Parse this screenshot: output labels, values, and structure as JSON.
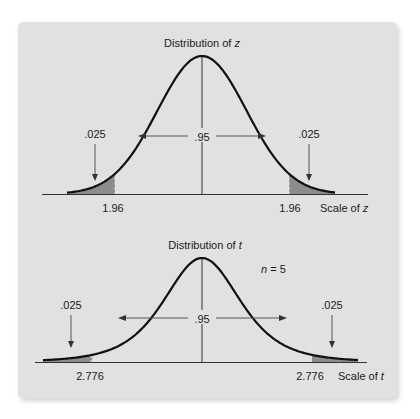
{
  "chart_data": [
    {
      "type": "area",
      "title": "Distribution of ",
      "title_var": "z",
      "distribution": "normal",
      "x_range": [
        -3.6,
        3.6
      ],
      "critical_values": [
        -1.96,
        1.96
      ],
      "critical_labels": [
        "1.96",
        "1.96"
      ],
      "tail_area_labels": [
        ".025",
        ".025"
      ],
      "center_area_label": ".95",
      "scale_label": "Scale of ",
      "scale_var": "z",
      "annotation": null,
      "colors": {
        "curve": "#111111",
        "tail_fill": "#8c8c8c",
        "axis": "#333333"
      }
    },
    {
      "type": "area",
      "title": "Distribution of ",
      "title_var": "t",
      "distribution": "student-t",
      "df": 4,
      "x_range": [
        -7,
        7
      ],
      "critical_values": [
        -2.776,
        2.776
      ],
      "critical_labels": [
        "2.776",
        "2.776"
      ],
      "tail_area_labels": [
        ".025",
        ".025"
      ],
      "center_area_label": ".95",
      "scale_label": "Scale of ",
      "scale_var": "t",
      "annotation": {
        "var": "n",
        "text": " = 5"
      },
      "colors": {
        "curve": "#111111",
        "tail_fill": "#8c8c8c",
        "axis": "#333333"
      }
    }
  ]
}
